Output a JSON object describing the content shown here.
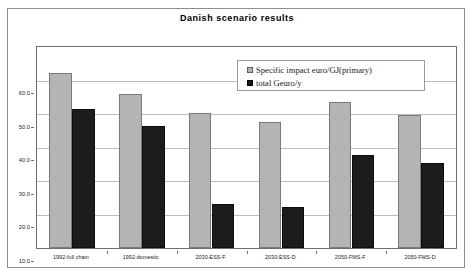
{
  "chart_data": {
    "type": "bar",
    "title": "Danish scenario results",
    "xlabel": "",
    "ylabel": "",
    "ylim": [
      0.0,
      60.0
    ],
    "ytick_labels": [
      "60.0",
      "50.0",
      "40.0",
      "30.0",
      "20.0",
      "10.0",
      "0.0"
    ],
    "ytick_values": [
      60.0,
      50.0,
      40.0,
      30.0,
      20.0,
      10.0,
      0.0
    ],
    "grid": true,
    "legend_position": "upper right",
    "categories": [
      "1992-full chain",
      "1992-domestic",
      "2030-ESS-F",
      "2030-ESS-D",
      "2050-FMS-F",
      "2050-FMS-D"
    ],
    "series": [
      {
        "name": "Specific impact euro/GJ(primary)",
        "color": "#b4b4b4",
        "values": [
          52.3,
          46.1,
          40.4,
          37.6,
          43.5,
          39.8
        ]
      },
      {
        "name": "total Geuro/y",
        "color": "#1c1c1c",
        "values": [
          41.6,
          36.4,
          13.2,
          12.3,
          27.8,
          25.4
        ]
      }
    ]
  },
  "colors": {
    "series_primary": "#b4b4b4",
    "series_secondary": "#1c1c1c",
    "gridline": "#bdbdbd",
    "axis": "#6e6e6e",
    "frame": "#8d8d8d",
    "background": "#ffffff",
    "text": "#1a1a1a"
  }
}
